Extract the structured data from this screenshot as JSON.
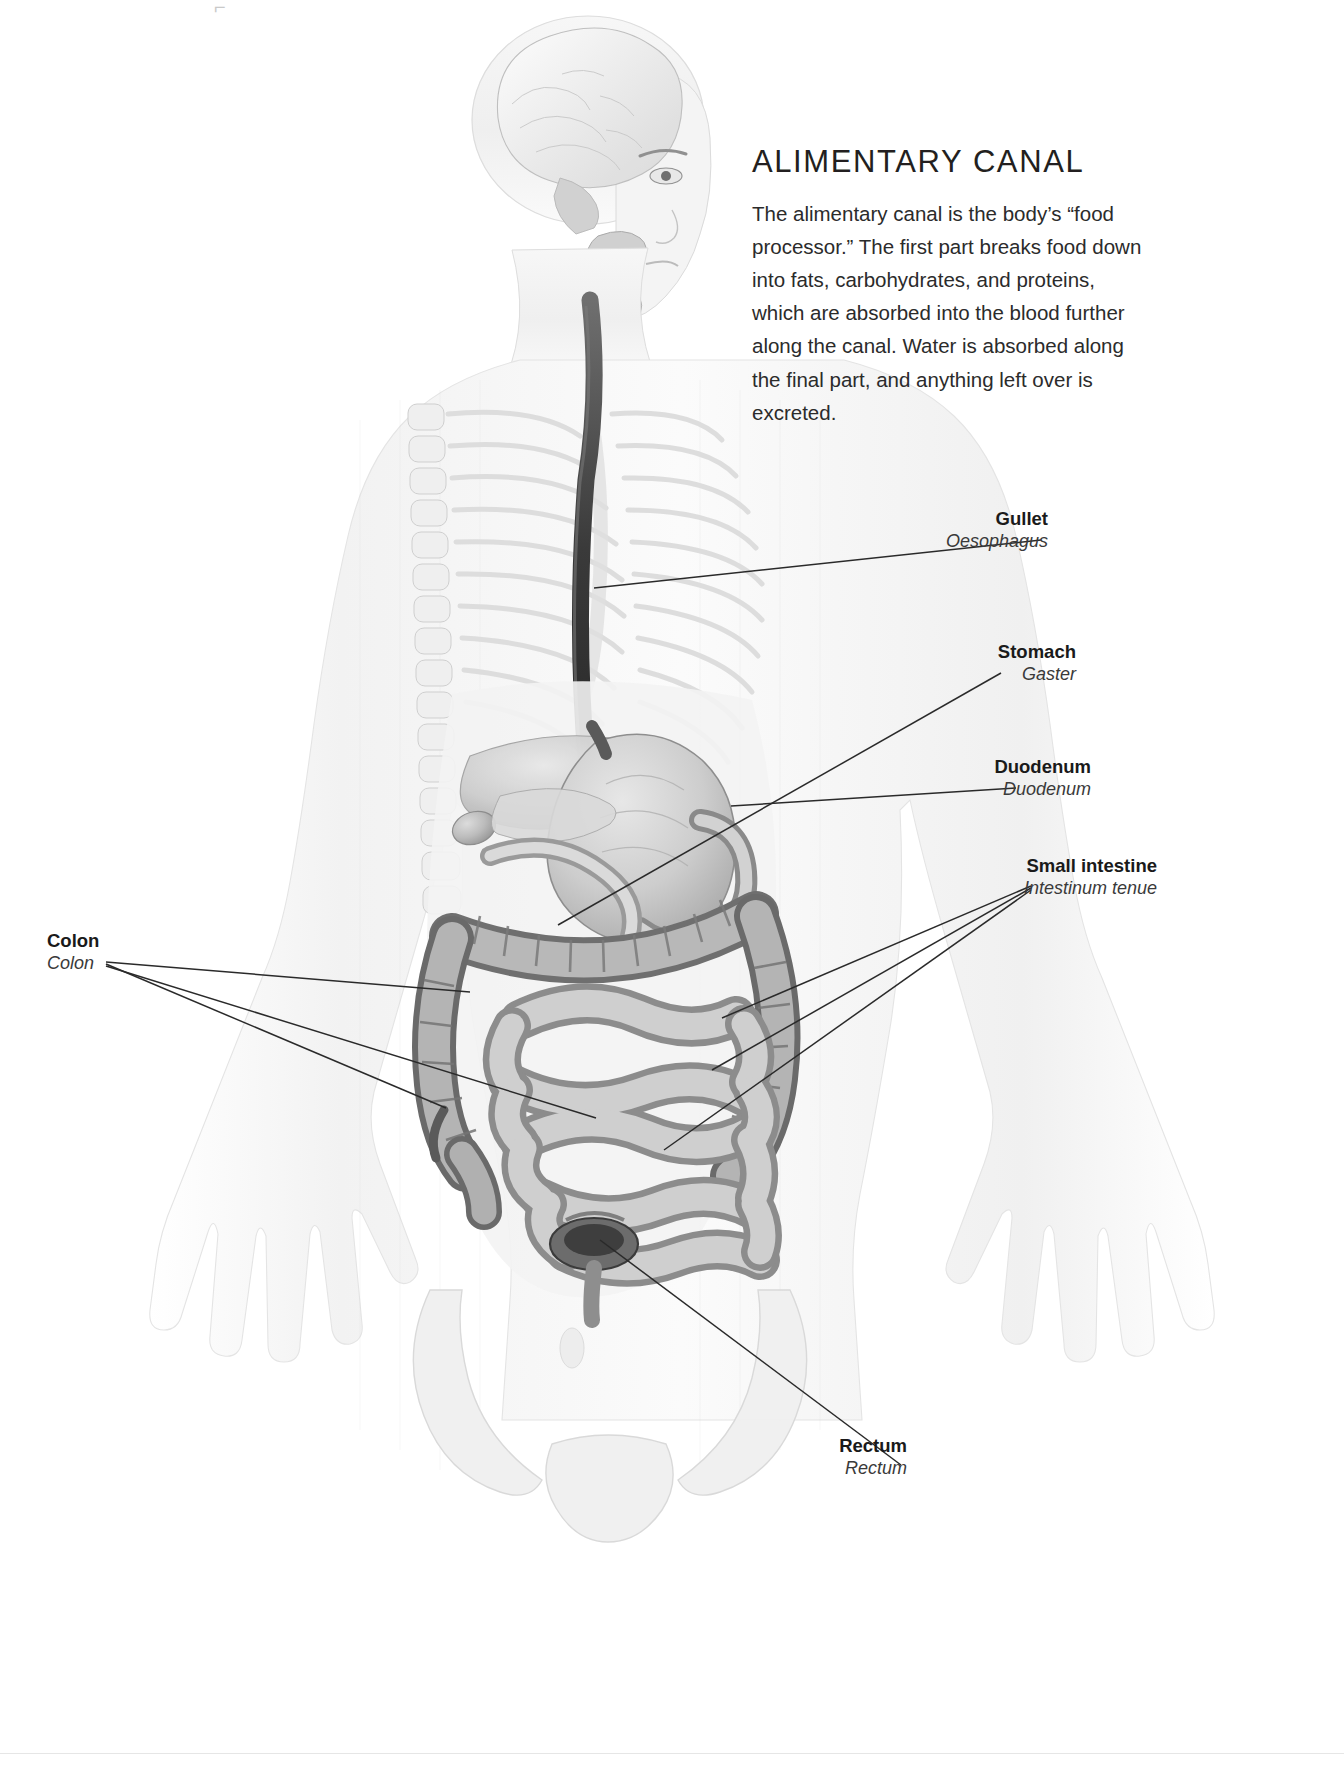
{
  "page": {
    "title": "ALIMENTARY CANAL",
    "intro": "The alimentary canal is the body’s “food processor.” The first part breaks food down into fats, carbohydrates, and proteins, which are absorbed into the blood further along the canal. Water is absorbed along the final part, and anything left over is excreted.",
    "background_color": "#ffffff",
    "ink_color": "#231f20",
    "leader_color": "#2a2a2a"
  },
  "illustration": {
    "subject": "human-male-torso-anterior-view",
    "style": "grayscale-anatomical-airbrush",
    "visible_structures": [
      "brain-sagittal-section",
      "head-and-face",
      "nasal-cavity",
      "spinal-column",
      "rib-cage",
      "oesophagus",
      "stomach",
      "liver",
      "gallbladder",
      "duodenum",
      "small-intestine",
      "colon",
      "rectum",
      "pelvis",
      "arms-and-hands"
    ]
  },
  "labels": [
    {
      "id": "gullet",
      "en": "Gullet",
      "la": "Oesophagus",
      "side": "right",
      "label_x": 1048,
      "label_y": 508,
      "leaders": [
        [
          1041,
          540,
          594,
          588
        ]
      ]
    },
    {
      "id": "stomach",
      "en": "Stomach",
      "la": "Gaster",
      "side": "right",
      "label_x": 1076,
      "label_y": 641,
      "leaders": [
        [
          1001,
          673,
          558,
          925
        ]
      ]
    },
    {
      "id": "duodenum",
      "en": "Duodenum",
      "la": "Duodenum",
      "side": "right",
      "label_x": 1091,
      "label_y": 756,
      "leaders": [
        [
          1016,
          788,
          731,
          806
        ]
      ]
    },
    {
      "id": "small-intestine",
      "en": "Small intestine",
      "la": "Intestinum tenue",
      "side": "right",
      "label_x": 1157,
      "label_y": 855,
      "leaders": [
        [
          1031,
          886,
          722,
          1018
        ],
        [
          1031,
          888,
          712,
          1070
        ],
        [
          1031,
          890,
          664,
          1150
        ]
      ]
    },
    {
      "id": "colon",
      "en": "Colon",
      "la": "Colon",
      "side": "left",
      "label_x": 47,
      "label_y": 930,
      "leaders": [
        [
          106,
          962,
          470,
          992
        ],
        [
          106,
          964,
          446,
          1108
        ],
        [
          106,
          966,
          596,
          1118
        ]
      ]
    },
    {
      "id": "rectum",
      "en": "Rectum",
      "la": "Rectum",
      "side": "right",
      "label_x": 907,
      "label_y": 1435,
      "leaders": [
        [
          901,
          1465,
          600,
          1240
        ]
      ]
    }
  ]
}
